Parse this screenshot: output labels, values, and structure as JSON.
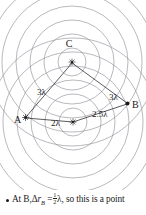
{
  "figure": {
    "type": "two-source-interference-wavefront-diagram",
    "sources": [
      {
        "name": "source-top",
        "label": "",
        "x": 72,
        "y": 62,
        "icon": "star-source-icon"
      },
      {
        "name": "source-bottom",
        "label": "",
        "x": 73,
        "y": 122,
        "icon": "star-source-icon"
      }
    ],
    "points": [
      {
        "name": "point-c",
        "label": "C",
        "x": 72,
        "y": 43
      },
      {
        "name": "point-a",
        "label": "A",
        "x": 24,
        "y": 118
      },
      {
        "name": "point-b",
        "label": "B",
        "x": 129,
        "y": 104
      }
    ],
    "distance_labels": [
      {
        "name": "distance-top-to-a",
        "label": "3λ",
        "x": 44,
        "y": 90
      },
      {
        "name": "distance-top-to-b",
        "label": "3λ",
        "x": 114,
        "y": 95
      },
      {
        "name": "distance-bottom-to-a",
        "label": "2λ",
        "x": 57,
        "y": 122
      },
      {
        "name": "distance-bottom-to-b",
        "label": "2.5λ",
        "x": 100,
        "y": 113
      }
    ],
    "wavefront_radii_top": [
      14,
      28,
      42,
      56,
      70,
      84
    ],
    "wavefront_radii_bottom": [
      14,
      28,
      42,
      56,
      70,
      84
    ],
    "colors": {
      "wavefront": "#8a8a92",
      "ray": "#27272c",
      "text": "#1a1a1a",
      "background": "#ffffff"
    }
  },
  "caption": {
    "bullet": "•",
    "lead": "At B,",
    "delta": "Δ",
    "r_symbol": "r",
    "r_subscript": "B",
    "equals": "=",
    "fraction_numerator": "1",
    "fraction_denominator": "2",
    "lambda": "λ",
    "tail": ", so this is a point"
  }
}
